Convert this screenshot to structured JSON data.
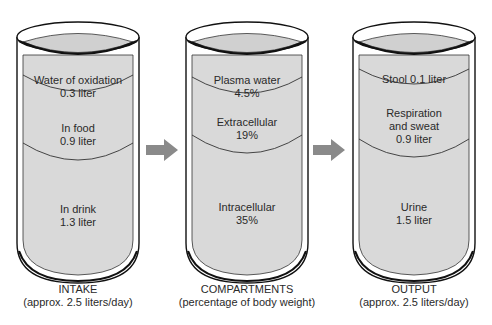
{
  "colors": {
    "liquid": "#d9d9d9",
    "outline": "#111111",
    "arrow": "#8a8a8a",
    "background": "#ffffff"
  },
  "arrows": [
    {
      "icon": "right-arrow-icon",
      "from": "intake",
      "to": "compartments"
    },
    {
      "icon": "right-arrow-icon",
      "from": "compartments",
      "to": "output"
    }
  ],
  "containers": [
    {
      "id": "intake",
      "caption_title": "INTAKE",
      "caption_sub": "(approx. 2.5 liters/day)",
      "layers": [
        {
          "name": "Water of oxidation",
          "value": "0.3 liter"
        },
        {
          "name": "In food",
          "value": "0.9 liter"
        },
        {
          "name": "In drink",
          "value": "1.3 liter"
        }
      ]
    },
    {
      "id": "compartments",
      "caption_title": "COMPARTMENTS",
      "caption_sub": "(percentage of body weight)",
      "layers": [
        {
          "name": "Plasma water",
          "value": "4.5%"
        },
        {
          "name": "Extracellular",
          "value": "19%"
        },
        {
          "name": "Intracellular",
          "value": "35%"
        }
      ]
    },
    {
      "id": "output",
      "caption_title": "OUTPUT",
      "caption_sub": "(approx. 2.5 liters/day)",
      "layers": [
        {
          "name": "Stool 0.1 liter",
          "value": ""
        },
        {
          "name": "Respiration",
          "name2": "and sweat",
          "value": "0.9 liter"
        },
        {
          "name": "Urine",
          "value": "1.5 liter"
        }
      ]
    }
  ]
}
